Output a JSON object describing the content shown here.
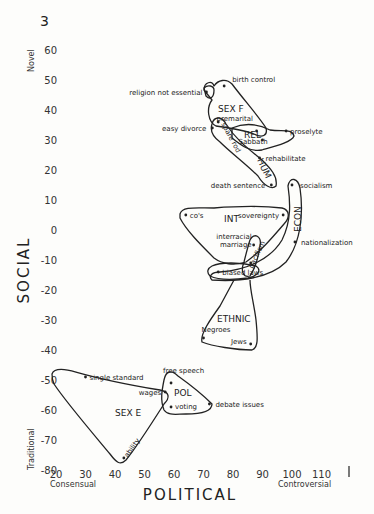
{
  "figure_number": "3",
  "chart_data": {
    "type": "scatter",
    "title": "",
    "xlabel": "POLITICAL",
    "ylabel": "SOCIAL",
    "x_low_label": "Consensual",
    "x_high_label": "Controversial",
    "y_high_label": "Novel",
    "y_low_label": "Traditional",
    "xlim": [
      20,
      115
    ],
    "ylim": [
      -80,
      65
    ],
    "x_ticks": [
      20,
      30,
      40,
      50,
      60,
      70,
      80,
      90,
      100,
      110
    ],
    "y_ticks": [
      60,
      50,
      40,
      30,
      20,
      10,
      0,
      -10,
      -20,
      -30,
      -40,
      -50,
      -60,
      -70,
      -80
    ],
    "grid": false,
    "points": [
      {
        "label": "religion not essential",
        "x": 71,
        "y": 46
      },
      {
        "label": "birth control",
        "x": 77,
        "y": 48
      },
      {
        "label": "premarital",
        "x": 88,
        "y": 33
      },
      {
        "label": "easy divorce",
        "x": 73,
        "y": 34
      },
      {
        "label": "spare rod",
        "x": 75,
        "y": 36
      },
      {
        "label": "Sabbath",
        "x": 90,
        "y": 30
      },
      {
        "label": "proselyte",
        "x": 98,
        "y": 33
      },
      {
        "label": "rehabilitate",
        "x": 89,
        "y": 24
      },
      {
        "label": "death sentence",
        "x": 93,
        "y": 15
      },
      {
        "label": "socialism",
        "x": 100,
        "y": 15
      },
      {
        "label": "co's",
        "x": 64,
        "y": 5
      },
      {
        "label": "sovereignty",
        "x": 97,
        "y": 5
      },
      {
        "label": "interracial marriage",
        "x": 87,
        "y": -5
      },
      {
        "label": "pacifism",
        "x": 86,
        "y": -11
      },
      {
        "label": "nationalization",
        "x": 101,
        "y": -4
      },
      {
        "label": "biased laws",
        "x": 75,
        "y": -14
      },
      {
        "label": "Negroes",
        "x": 70,
        "y": -36
      },
      {
        "label": "Jews",
        "x": 86,
        "y": -38
      },
      {
        "label": "free speech",
        "x": 59,
        "y": -51
      },
      {
        "label": "single standard",
        "x": 30,
        "y": -49
      },
      {
        "label": "wages",
        "x": 57,
        "y": -54
      },
      {
        "label": "voting",
        "x": 59,
        "y": -59
      },
      {
        "label": "debate issues",
        "x": 72,
        "y": -58
      },
      {
        "label": "ability",
        "x": 43,
        "y": -76
      }
    ],
    "groups": [
      {
        "name": "SEX F",
        "members": [
          "religion not essential",
          "birth control",
          "premarital"
        ]
      },
      {
        "name": "REL",
        "members": [
          "Sabbath",
          "proselyte"
        ]
      },
      {
        "name": "HUM",
        "members": [
          "easy divorce",
          "spare rod",
          "rehabilitate",
          "death sentence"
        ]
      },
      {
        "name": "ECON",
        "members": [
          "socialism",
          "nationalization",
          "biased laws"
        ]
      },
      {
        "name": "INT",
        "members": [
          "co's",
          "sovereignty",
          "interracial marriage",
          "pacifism"
        ]
      },
      {
        "name": "ETHNIC",
        "members": [
          "biased laws",
          "Negroes",
          "Jews"
        ]
      },
      {
        "name": "POL",
        "members": [
          "free speech",
          "wages",
          "voting",
          "debate issues"
        ]
      },
      {
        "name": "SEX E",
        "members": [
          "single standard",
          "wages",
          "ability"
        ]
      }
    ]
  }
}
